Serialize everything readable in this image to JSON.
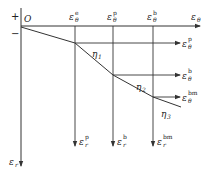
{
  "diagram": {
    "origin_label": "O",
    "plus_sign": "+",
    "minus_sign": "−",
    "horizontal_axis": {
      "symbol": "ε",
      "subscript": "θ",
      "superscript": ""
    },
    "vertical_axis": {
      "symbol": "ε",
      "subscript": "r",
      "superscript": ""
    },
    "top_labels": [
      {
        "symbol": "ε",
        "subscript": "θ",
        "superscript": "e"
      },
      {
        "symbol": "ε",
        "subscript": "θ",
        "superscript": "p"
      },
      {
        "symbol": "ε",
        "subscript": "θ",
        "superscript": "b"
      }
    ],
    "right_labels": [
      {
        "symbol": "ε",
        "subscript": "θ",
        "superscript": "p"
      },
      {
        "symbol": "ε",
        "subscript": "θ",
        "superscript": "b"
      },
      {
        "symbol": "ε",
        "subscript": "θ",
        "superscript": "bm"
      }
    ],
    "bottom_labels": [
      {
        "symbol": "ε",
        "subscript": "r",
        "superscript": "p"
      },
      {
        "symbol": "ε",
        "subscript": "r",
        "superscript": "b"
      },
      {
        "symbol": "ε",
        "subscript": "r",
        "superscript": "bm"
      }
    ],
    "slopes": [
      {
        "symbol": "η",
        "subscript": "1"
      },
      {
        "symbol": "η",
        "subscript": "2"
      },
      {
        "symbol": "η",
        "subscript": "3"
      }
    ],
    "line_color": "#333333"
  }
}
